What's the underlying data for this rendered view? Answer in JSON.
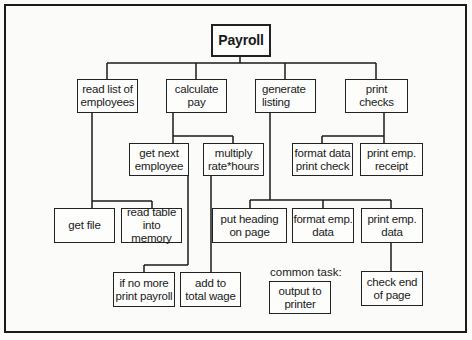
{
  "diagram": {
    "type": "structure-chart",
    "root": "Payroll",
    "nodes": {
      "root": "Payroll",
      "read_list": "read list of\nemployees",
      "calculate": "calculate\npay",
      "generate": "generate\nlisting",
      "print_checks": "print\nchecks",
      "get_next": "get next\nemployee",
      "multiply": "multiply\nrate*hours",
      "format_data": "format data\nprint check",
      "print_receipt": "print emp.\nreceipt",
      "get_file": "get file",
      "read_table": "read table\ninto memory",
      "put_heading": "put heading\non page",
      "format_emp": "format emp.\ndata",
      "print_emp_data": "print emp.\ndata",
      "if_no_more": "if no more\nprint payroll",
      "add_to": "add to\ntotal wage",
      "output_printer": "output to\nprinter",
      "check_end": "check end\nof page"
    },
    "common_task_label": "common task:",
    "edges": [
      [
        "Payroll",
        "read list of employees"
      ],
      [
        "Payroll",
        "calculate pay"
      ],
      [
        "Payroll",
        "generate listing"
      ],
      [
        "Payroll",
        "print checks"
      ],
      [
        "read list of employees",
        "get file"
      ],
      [
        "read list of employees",
        "read table into memory"
      ],
      [
        "calculate pay",
        "get next employee"
      ],
      [
        "calculate pay",
        "multiply rate*hours"
      ],
      [
        "get next employee",
        "if no more print payroll"
      ],
      [
        "multiply rate*hours",
        "add to total wage"
      ],
      [
        "generate listing",
        "put heading on page"
      ],
      [
        "generate listing",
        "format emp. data"
      ],
      [
        "generate listing",
        "print emp. data"
      ],
      [
        "print emp. data",
        "check end of page"
      ],
      [
        "print checks",
        "format data print check"
      ],
      [
        "print checks",
        "print emp. receipt"
      ]
    ]
  }
}
